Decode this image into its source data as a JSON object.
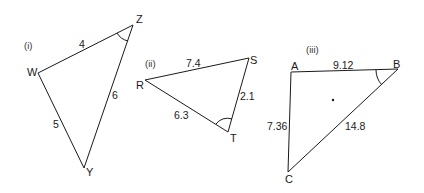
{
  "figure": {
    "background": "#ffffff",
    "stroke_color": "#1a1a1a",
    "triangles": [
      {
        "id": "i",
        "tag": "(i)",
        "vertices": {
          "Z": "Z",
          "W": "W",
          "Y": "Y"
        },
        "sides": {
          "WZ": "4",
          "ZY": "6",
          "WY": "5"
        },
        "marked_angle": "Z"
      },
      {
        "id": "ii",
        "tag": "(ii)",
        "vertices": {
          "R": "R",
          "S": "S",
          "T": "T"
        },
        "sides": {
          "RS": "7.4",
          "ST": "2.1",
          "RT": "6.3"
        },
        "marked_angle": "T"
      },
      {
        "id": "iii",
        "tag": "(iii)",
        "vertices": {
          "A": "A",
          "B": "B",
          "C": "C"
        },
        "sides": {
          "AB": "9.12",
          "AC": "7.36",
          "BC": "14.8"
        },
        "marked_angle": "B"
      }
    ]
  }
}
